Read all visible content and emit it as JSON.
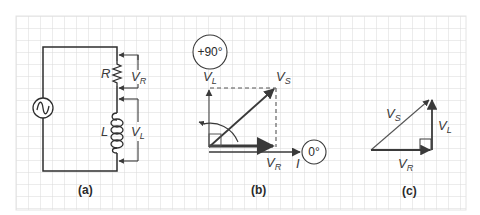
{
  "figure": {
    "background": "#ffffff",
    "grid": {
      "minor_color": "#d6d6d6",
      "major_color": "#b8b8b8",
      "spacing_px": 12
    },
    "line_color": "#2e2e2e",
    "arrow_color": "#3a3a3a"
  },
  "panel_a": {
    "caption": "(a)",
    "source_symbol": "ac-source",
    "resistor_label": "R",
    "inductor_label": "L",
    "vr_label": {
      "main": "V",
      "sub": "R"
    },
    "vl_label": {
      "main": "V",
      "sub": "L"
    }
  },
  "panel_b": {
    "caption": "(b)",
    "angle_top": "+90°",
    "angle_right": "0°",
    "vl_label": {
      "main": "V",
      "sub": "L"
    },
    "vs_label": {
      "main": "V",
      "sub": "S"
    },
    "vr_label": {
      "main": "V",
      "sub": "R"
    },
    "current_label": "I"
  },
  "panel_c": {
    "caption": "(c)",
    "vs_label": {
      "main": "V",
      "sub": "S"
    },
    "vl_label": {
      "main": "V",
      "sub": "L"
    },
    "vr_label": {
      "main": "V",
      "sub": "R"
    }
  }
}
